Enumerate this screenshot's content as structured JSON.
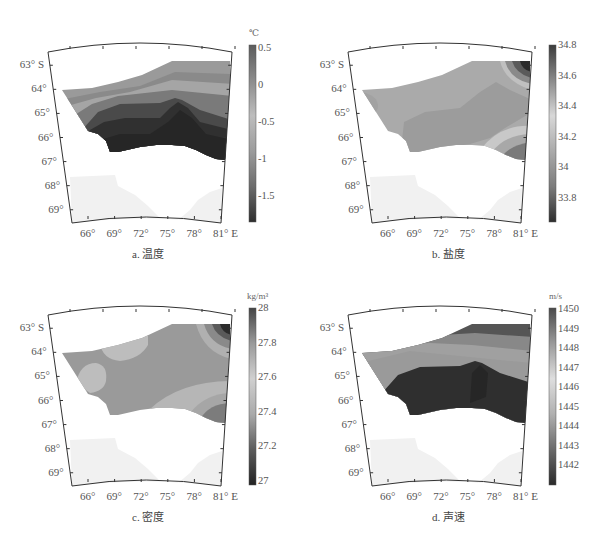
{
  "figure": {
    "panels": [
      {
        "id": "a",
        "caption": "a. 温度",
        "unit": "℃",
        "cb_ticks": [
          "0.5",
          "0",
          "-0.5",
          "-1",
          "-1.5"
        ]
      },
      {
        "id": "b",
        "caption": "b. 盐度",
        "unit": "",
        "cb_ticks": [
          "34.8",
          "34.6",
          "34.4",
          "34.2",
          "34",
          "33.8"
        ]
      },
      {
        "id": "c",
        "caption": "c. 密度",
        "unit": "kg/m³",
        "cb_ticks": [
          "28",
          "27.8",
          "27.6",
          "27.4",
          "27.2",
          "27"
        ]
      },
      {
        "id": "d",
        "caption": "d. 声速",
        "unit": "m/s",
        "cb_ticks": [
          "1450",
          "1449",
          "1448",
          "1447",
          "1446",
          "1445",
          "1444",
          "1443",
          "1442"
        ]
      }
    ],
    "lat_labels": [
      "63° S",
      "64°",
      "65°",
      "66°",
      "67°",
      "68°",
      "69°"
    ],
    "lon_labels": [
      "66°",
      "69°",
      "72°",
      "75°",
      "78°",
      "81° E"
    ]
  },
  "chart_data": [
    {
      "type": "heatmap",
      "title": "a. 温度",
      "variable": "Temperature",
      "unit": "℃",
      "colorbar": {
        "min": -1.8,
        "max": 0.6,
        "ticks": [
          0.5,
          0,
          -0.5,
          -1,
          -1.5
        ],
        "colormap": "gray (dark=low)"
      },
      "xlabel": "Longitude (°E)",
      "ylabel": "Latitude (°S)",
      "x_ticks": [
        66,
        69,
        72,
        75,
        78,
        81
      ],
      "y_ticks": [
        63,
        64,
        65,
        66,
        67,
        68,
        69
      ],
      "xlim": [
        63,
        82
      ],
      "ylim": [
        63,
        69.5
      ],
      "description": "Warm (~0.5) band along northern edge, decreasing southward; coldest (<-1.5) near 66-67°S along the coast, with a tongue of cold water reaching north near 75-76°E."
    },
    {
      "type": "heatmap",
      "title": "b. 盐度",
      "variable": "Salinity",
      "unit": "",
      "colorbar": {
        "min": 33.65,
        "max": 34.8,
        "ticks": [
          34.8,
          34.6,
          34.4,
          34.2,
          34,
          33.8
        ],
        "colormap": "gray"
      },
      "xlabel": "Longitude (°E)",
      "ylabel": "Latitude (°S)",
      "x_ticks": [
        66,
        69,
        72,
        75,
        78,
        81
      ],
      "y_ticks": [
        63,
        64,
        65,
        66,
        67,
        68,
        69
      ],
      "xlim": [
        63,
        82
      ],
      "ylim": [
        63,
        69.5
      ],
      "description": "Mostly ~34.3-34.5 across region; extreme high salinity (~34.8) in NE corner near 81°E 63°S; low-salinity lens near 80°E 66.5°S."
    },
    {
      "type": "heatmap",
      "title": "c. 密度",
      "variable": "Density",
      "unit": "kg/m³",
      "colorbar": {
        "min": 27.0,
        "max": 28.0,
        "ticks": [
          28,
          27.8,
          27.6,
          27.4,
          27.2,
          27
        ],
        "colormap": "gray"
      },
      "xlabel": "Longitude (°E)",
      "ylabel": "Latitude (°S)",
      "x_ticks": [
        66,
        69,
        72,
        75,
        78,
        81
      ],
      "y_ticks": [
        63,
        64,
        65,
        66,
        67,
        68,
        69
      ],
      "xlim": [
        63,
        82
      ],
      "ylim": [
        63,
        69.5
      ],
      "description": "Mostly ~27.7-27.8 across region; lighter patches (~27.6) near 67°E 65°S and 70°E 64°S; densest (~28) in NE corner near 81°E 63°S; moderate-high near 80°E 66.5°S."
    },
    {
      "type": "heatmap",
      "title": "d. 声速",
      "variable": "Sound speed",
      "unit": "m/s",
      "colorbar": {
        "min": 1441.3,
        "max": 1450,
        "ticks": [
          1450,
          1449,
          1448,
          1447,
          1446,
          1445,
          1444,
          1443,
          1442
        ],
        "colormap": "gray (dark=low)"
      },
      "xlabel": "Longitude (°E)",
      "ylabel": "Latitude (°S)",
      "x_ticks": [
        66,
        69,
        72,
        75,
        78,
        81
      ],
      "y_ticks": [
        63,
        64,
        65,
        66,
        67,
        68,
        69
      ],
      "xlim": [
        63,
        82
      ],
      "ylim": [
        63,
        69.5
      ],
      "description": "Highest (~1449) along northern edge near 63°S, decreasing southward in bands; lowest (~1442) near 65.5-67°S coast with tongue near 75-76°E."
    }
  ]
}
